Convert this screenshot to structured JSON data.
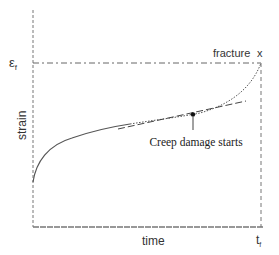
{
  "diagram": {
    "type": "creep-curve",
    "labels": {
      "y_axis": "strain",
      "x_axis": "time",
      "y_tick": "ε",
      "y_tick_subscript": "f",
      "x_tick": "t",
      "x_tick_subscript": "f",
      "fracture": "fracture",
      "fracture_marker": "x",
      "annotation": "Creep damage starts"
    },
    "colors": {
      "curve": "#555555",
      "axis": "#777777",
      "guide": "#666666",
      "text": "#333333"
    }
  }
}
